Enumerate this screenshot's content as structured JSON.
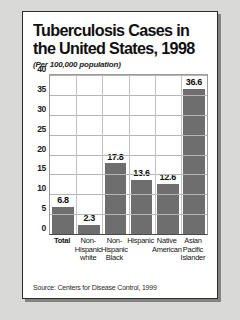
{
  "card": {
    "title_line1": "Tuberculosis Cases in",
    "title_line2": "the United States, 1998",
    "subtitle": "(Per 100,000 population)",
    "source": "Source: Centers for Disease Control, 1999"
  },
  "chart_data": {
    "type": "bar",
    "title": "Tuberculosis Cases in the United States, 1998",
    "subtitle": "(Per 100,000 population)",
    "xlabel": "",
    "ylabel": "",
    "ylim": [
      0,
      40
    ],
    "yticks": [
      0,
      5,
      10,
      15,
      20,
      25,
      30,
      35,
      40
    ],
    "ytick_labels": [
      "0",
      "5",
      "10",
      "15",
      "20",
      "25",
      "30",
      "35",
      "40"
    ],
    "grid": true,
    "legend": false,
    "bar_color": "#6e6e6e",
    "categories": [
      "Total",
      "Non-Hispanic white",
      "Non-Hispanic Black",
      "Hispanic",
      "Native American",
      "Asian Pacific Islander"
    ],
    "category_lines": [
      [
        "Total"
      ],
      [
        "Non-",
        "Hispanic",
        "white"
      ],
      [
        "Non-",
        "Hispanic",
        "Black"
      ],
      [
        "Hispanic"
      ],
      [
        "Native",
        "American"
      ],
      [
        "Asian",
        "Pacific",
        "Islander"
      ]
    ],
    "values": [
      6.8,
      2.3,
      17.8,
      13.6,
      12.6,
      36.6
    ],
    "value_labels": [
      "6.8",
      "2.3",
      "17.8",
      "13.6",
      "12.6",
      "36.6"
    ],
    "source": "Source: Centers for Disease Control, 1999"
  }
}
